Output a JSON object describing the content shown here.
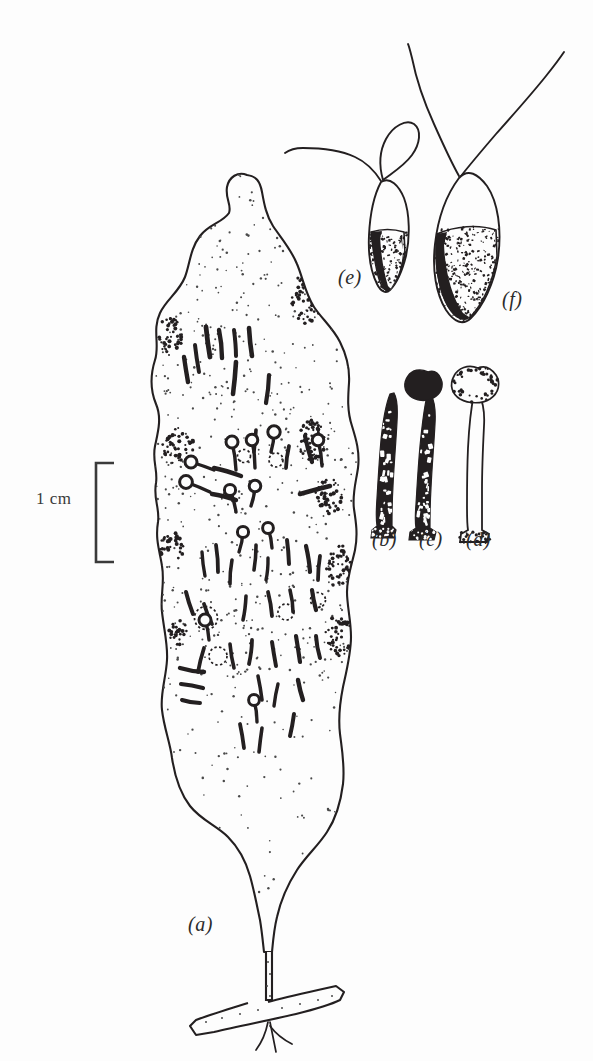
{
  "figure": {
    "domain_note": "scientific line drawing plate",
    "background_color": "#fdfdfd",
    "ink_color": "#231f20",
    "stipple_color": "#4a4a4a",
    "width": 593,
    "height": 1061
  },
  "scale_bar": {
    "label": "1 cm",
    "label_x": 36,
    "label_y": 498,
    "bracket_x": 96,
    "bracket_top": 463,
    "bracket_bottom": 562,
    "bracket_tick_length": 18,
    "stroke_color": "#3a3a3a",
    "stroke_width": 2.6
  },
  "panels": [
    {
      "id": "a",
      "label": "(a)",
      "label_x": 188,
      "label_y": 925,
      "description": "whole lobed thallus with basal stolon and rhizoids"
    },
    {
      "id": "b",
      "label": "(b)",
      "label_x": 372,
      "label_y": 540,
      "description": "dark tapering rod-shaped element"
    },
    {
      "id": "c",
      "label": "(c)",
      "label_x": 419,
      "label_y": 540,
      "description": "dark stalked element with lobed head"
    },
    {
      "id": "d",
      "label": "(d)",
      "label_x": 466,
      "label_y": 540,
      "description": "pale stalked element with lobed head"
    },
    {
      "id": "e",
      "label": "(e)",
      "label_x": 338,
      "label_y": 278,
      "description": "small biflagellate cell, one appendage looped"
    },
    {
      "id": "f",
      "label": "(f)",
      "label_x": 502,
      "label_y": 300,
      "description": "larger biflagellate cell with speckled body"
    }
  ],
  "body_outline": {
    "path": "M 247 175 C 238 171 229 177 227 187 C 225 199 232 205 229 213 C 222 223 209 224 200 236 C 190 249 190 264 185 277 C 179 292 166 300 160 313 C 152 330 160 345 155 360 C 150 376 151 392 156 404 C 162 418 158 432 155 446 C 152 461 158 470 156 483 C 153 499 160 508 158 522 C 155 540 160 552 162 566 C 165 583 160 597 162 612 C 164 630 168 645 167 660 C 166 678 160 694 162 710 C 164 728 170 742 172 758 C 175 778 180 793 190 806 C 201 820 217 826 228 837 C 240 849 246 862 250 876 C 254 890 257 906 260 920 C 262 932 263 943 264 952 L 272 952 C 273 941 274 929 277 917 C 281 899 288 884 297 870 C 306 856 318 846 327 832 C 337 817 341 800 343 784 C 345 766 342 750 340 734 C 338 717 340 702 343 687 C 347 669 351 653 351 637 C 351 620 347 606 347 592 C 347 577 352 564 355 550 C 358 535 356 522 354 509 C 352 494 356 482 358 468 C 360 452 356 439 352 426 C 347 411 348 397 349 383 C 350 367 346 354 340 342 C 333 328 322 319 314 307 C 305 293 303 278 297 264 C 291 249 281 238 273 226 C 266 215 264 203 262 192 C 260 181 256 176 247 175 Z"
  },
  "stolon": {
    "main_path": "M 266 952 L 266 1000 L 272 1000 L 272 952",
    "cross_path": "M 248 1003 C 232 1008 212 1014 196 1020 L 190 1026 L 196 1035 L 214 1032 C 240 1026 270 1020 296 1014 C 312 1010 328 1006 340 1000 L 344 992 L 336 986 L 318 990 C 300 994 282 998 268 1002",
    "rhizoid_paths": [
      "M 268 1022 C 266 1032 262 1042 256 1050",
      "M 270 1022 C 272 1032 274 1042 276 1052",
      "M 270 1026 C 276 1034 284 1040 292 1044"
    ]
  },
  "larva_e": {
    "body_path": "M 381 182 C 374 195 370 215 369 235 C 368 255 371 272 377 284 C 381 292 386 294 390 290 C 396 284 402 272 406 256 C 410 238 410 214 404 198 C 399 186 390 176 381 182 Z",
    "pigment_path": "M 371 232 C 373 250 375 268 380 282 C 384 291 388 293 392 288 C 397 281 402 268 405 254 L 404 232 C 394 229 381 229 371 232 Z",
    "flagellum_long": "M 381 181 C 374 170 366 162 355 157 C 340 150 320 148 303 148 C 296 148 289 150 285 153",
    "flagellum_loop": "M 383 180 C 379 166 379 152 386 139 C 393 126 406 119 414 124 C 422 130 420 144 412 155 C 404 166 392 173 383 180"
  },
  "larva_f": {
    "body_path": "M 459 178 C 447 194 438 218 435 244 C 432 270 436 294 446 310 C 454 322 463 326 471 318 C 483 306 494 284 498 258 C 502 230 498 202 487 186 C 478 174 468 168 459 178 Z",
    "pigment_path": "M 437 234 C 434 260 438 288 448 306 C 456 319 465 323 472 315 C 483 303 493 282 497 256 L 496 230 C 478 224 455 226 437 234 Z",
    "flagellum_left": "M 459 176 C 450 160 442 142 434 124 C 424 102 416 78 412 58 C 410 50 409 46 408 44",
    "flagellum_right": "M 461 176 C 472 162 484 148 496 134 C 512 116 530 96 546 76 C 554 66 560 58 564 52"
  },
  "element_b": {
    "outline_path": "M 390 394 C 386 404 383 420 381 440 C 379 462 378 482 377 498 C 376 512 376 520 377 526 L 372 530 L 371 538 L 394 538 L 396 530 L 392 526 C 392 516 392 502 393 486 C 394 464 396 442 397 422 C 398 406 397 398 394 393 Z",
    "head_type": "none"
  },
  "element_c": {
    "stalk_path": "M 427 396 C 424 408 422 426 420 446 C 418 468 417 488 416 504 C 415 516 415 522 416 528 L 410 532 L 409 540 L 434 540 L 436 532 L 430 528 C 430 518 430 504 431 488 C 432 466 434 444 435 424 C 436 408 434 400 431 395 Z",
    "head_path": "M 428 372 C 420 368 412 370 408 376 C 403 383 404 391 410 396 C 416 401 426 402 433 398 C 441 394 444 386 441 379 C 438 372 434 370 428 372 Z",
    "head_type": "lobed-dark"
  },
  "element_d": {
    "stalk_path": "M 474 394 C 471 408 469 428 468 448 C 467 470 467 490 467 506 C 467 518 467 524 468 530 L 461 534 L 460 542 L 487 542 L 489 534 L 482 530 C 482 520 482 506 482 490 C 482 468 483 446 484 426 C 485 410 482 400 479 394 Z",
    "head_path": "M 478 368 C 468 364 458 368 454 376 C 449 385 452 394 460 399 C 469 404 482 404 490 399 C 499 393 501 383 496 375 C 491 368 485 365 478 368 Z",
    "head_type": "lobed-pale"
  },
  "rods": [
    {
      "x1": 236,
      "y1": 362,
      "x2": 233,
      "y2": 394,
      "w": 4.6
    },
    {
      "x1": 269,
      "y1": 375,
      "x2": 266,
      "y2": 403,
      "w": 4.2
    },
    {
      "x1": 206,
      "y1": 327,
      "x2": 210,
      "y2": 357,
      "w": 4.8
    },
    {
      "x1": 219,
      "y1": 330,
      "x2": 222,
      "y2": 358,
      "w": 4.4
    },
    {
      "x1": 234,
      "y1": 330,
      "x2": 236,
      "y2": 356,
      "w": 4.0
    },
    {
      "x1": 249,
      "y1": 328,
      "x2": 252,
      "y2": 356,
      "w": 4.6
    },
    {
      "x1": 195,
      "y1": 345,
      "x2": 199,
      "y2": 372,
      "w": 4.0
    },
    {
      "x1": 184,
      "y1": 357,
      "x2": 188,
      "y2": 382,
      "w": 4.4
    },
    {
      "x1": 256,
      "y1": 430,
      "x2": 254,
      "y2": 452,
      "w": 3.6
    },
    {
      "x1": 289,
      "y1": 446,
      "x2": 286,
      "y2": 468,
      "w": 3.8
    },
    {
      "x1": 305,
      "y1": 436,
      "x2": 312,
      "y2": 462,
      "w": 4.2
    },
    {
      "x1": 287,
      "y1": 540,
      "x2": 289,
      "y2": 564,
      "w": 4.0
    },
    {
      "x1": 256,
      "y1": 545,
      "x2": 254,
      "y2": 570,
      "w": 3.6
    },
    {
      "x1": 216,
      "y1": 545,
      "x2": 218,
      "y2": 572,
      "w": 3.8
    },
    {
      "x1": 202,
      "y1": 552,
      "x2": 205,
      "y2": 576,
      "w": 3.4
    },
    {
      "x1": 232,
      "y1": 560,
      "x2": 230,
      "y2": 584,
      "w": 3.6
    },
    {
      "x1": 268,
      "y1": 558,
      "x2": 266,
      "y2": 580,
      "w": 3.4
    },
    {
      "x1": 306,
      "y1": 546,
      "x2": 310,
      "y2": 572,
      "w": 4.2
    },
    {
      "x1": 320,
      "y1": 556,
      "x2": 318,
      "y2": 580,
      "w": 3.8
    },
    {
      "x1": 186,
      "y1": 592,
      "x2": 193,
      "y2": 614,
      "w": 4.0
    },
    {
      "x1": 204,
      "y1": 604,
      "x2": 212,
      "y2": 624,
      "w": 3.8
    },
    {
      "x1": 246,
      "y1": 596,
      "x2": 243,
      "y2": 620,
      "w": 3.6
    },
    {
      "x1": 268,
      "y1": 592,
      "x2": 272,
      "y2": 616,
      "w": 3.8
    },
    {
      "x1": 290,
      "y1": 590,
      "x2": 293,
      "y2": 612,
      "w": 3.6
    },
    {
      "x1": 312,
      "y1": 590,
      "x2": 316,
      "y2": 610,
      "w": 4.2
    },
    {
      "x1": 180,
      "y1": 668,
      "x2": 204,
      "y2": 672,
      "w": 4.4
    },
    {
      "x1": 181,
      "y1": 684,
      "x2": 203,
      "y2": 688,
      "w": 4.2
    },
    {
      "x1": 182,
      "y1": 700,
      "x2": 200,
      "y2": 703,
      "w": 4.0
    },
    {
      "x1": 204,
      "y1": 648,
      "x2": 198,
      "y2": 672,
      "w": 3.8
    },
    {
      "x1": 230,
      "y1": 644,
      "x2": 234,
      "y2": 668,
      "w": 3.6
    },
    {
      "x1": 252,
      "y1": 640,
      "x2": 249,
      "y2": 664,
      "w": 3.8
    },
    {
      "x1": 272,
      "y1": 642,
      "x2": 276,
      "y2": 666,
      "w": 4.0
    },
    {
      "x1": 296,
      "y1": 636,
      "x2": 300,
      "y2": 662,
      "w": 4.2
    },
    {
      "x1": 316,
      "y1": 636,
      "x2": 320,
      "y2": 658,
      "w": 4.0
    },
    {
      "x1": 258,
      "y1": 676,
      "x2": 262,
      "y2": 700,
      "w": 3.6
    },
    {
      "x1": 278,
      "y1": 684,
      "x2": 274,
      "y2": 706,
      "w": 3.4
    },
    {
      "x1": 298,
      "y1": 680,
      "x2": 303,
      "y2": 700,
      "w": 4.4
    },
    {
      "x1": 240,
      "y1": 724,
      "x2": 244,
      "y2": 748,
      "w": 3.8
    },
    {
      "x1": 262,
      "y1": 728,
      "x2": 259,
      "y2": 752,
      "w": 3.6
    },
    {
      "x1": 294,
      "y1": 714,
      "x2": 290,
      "y2": 736,
      "w": 4.0
    },
    {
      "x1": 214,
      "y1": 468,
      "x2": 241,
      "y2": 476,
      "w": 4.4
    },
    {
      "x1": 212,
      "y1": 494,
      "x2": 236,
      "y2": 500,
      "w": 4.4
    },
    {
      "x1": 300,
      "y1": 494,
      "x2": 330,
      "y2": 486,
      "w": 4.6
    }
  ],
  "pins": [
    {
      "hx": 232,
      "hy": 442,
      "tx": 236,
      "ty": 470,
      "r": 6.0
    },
    {
      "hx": 252,
      "hy": 440,
      "tx": 255,
      "ty": 468,
      "r": 5.8
    },
    {
      "hx": 274,
      "hy": 432,
      "tx": 271,
      "ty": 452,
      "r": 6.2
    },
    {
      "hx": 318,
      "hy": 440,
      "tx": 322,
      "ty": 466,
      "r": 5.8
    },
    {
      "hx": 191,
      "hy": 462,
      "tx": 214,
      "ty": 470,
      "r": 6.0
    },
    {
      "hx": 186,
      "hy": 482,
      "tx": 210,
      "ty": 492,
      "r": 6.4
    },
    {
      "hx": 230,
      "hy": 490,
      "tx": 236,
      "ty": 512,
      "r": 5.6
    },
    {
      "hx": 255,
      "hy": 486,
      "tx": 251,
      "ty": 506,
      "r": 5.8
    },
    {
      "hx": 243,
      "hy": 532,
      "tx": 239,
      "ty": 552,
      "r": 5.6
    },
    {
      "hx": 268,
      "hy": 528,
      "tx": 272,
      "ty": 548,
      "r": 5.4
    },
    {
      "hx": 254,
      "hy": 700,
      "tx": 257,
      "ty": 722,
      "r": 5.4
    },
    {
      "hx": 205,
      "hy": 620,
      "tx": 209,
      "ty": 640,
      "r": 6.0
    }
  ],
  "rings": [
    {
      "cx": 206,
      "cy": 618,
      "r": 11.5
    },
    {
      "cx": 218,
      "cy": 656,
      "r": 9.0
    },
    {
      "cx": 286,
      "cy": 612,
      "r": 8.0
    },
    {
      "cx": 244,
      "cy": 456,
      "r": 6.5
    },
    {
      "cx": 276,
      "cy": 460,
      "r": 7.0
    },
    {
      "cx": 318,
      "cy": 600,
      "r": 7.5
    }
  ],
  "crenulation_clusters": [
    {
      "cx": 307,
      "cy": 298,
      "rx": 16,
      "ry": 26,
      "n": 62
    },
    {
      "cx": 170,
      "cy": 336,
      "rx": 12,
      "ry": 20,
      "n": 40
    },
    {
      "cx": 178,
      "cy": 446,
      "rx": 16,
      "ry": 18,
      "n": 48
    },
    {
      "cx": 311,
      "cy": 440,
      "rx": 14,
      "ry": 22,
      "n": 50
    },
    {
      "cx": 329,
      "cy": 496,
      "rx": 14,
      "ry": 18,
      "n": 44
    },
    {
      "cx": 340,
      "cy": 566,
      "rx": 14,
      "ry": 22,
      "n": 48
    },
    {
      "cx": 172,
      "cy": 548,
      "rx": 12,
      "ry": 16,
      "n": 34
    },
    {
      "cx": 338,
      "cy": 636,
      "rx": 14,
      "ry": 20,
      "n": 44
    },
    {
      "cx": 178,
      "cy": 634,
      "rx": 10,
      "ry": 14,
      "n": 26
    }
  ]
}
